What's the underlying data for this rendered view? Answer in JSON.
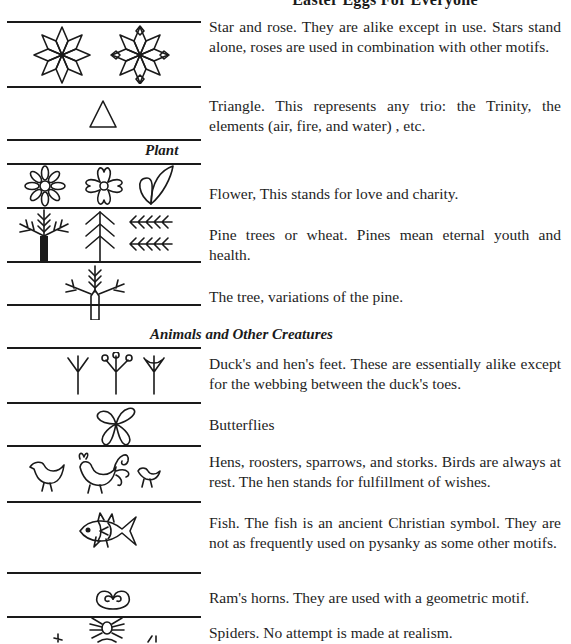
{
  "page": {
    "title": "Easter Eggs For Everyone"
  },
  "sections": {
    "plant": {
      "heading": "Plant"
    },
    "animals": {
      "heading": "Animals and Other Creatures"
    }
  },
  "motifs": [
    {
      "id": "star-rose",
      "icon": "star-rose-icon",
      "text": "Star and rose. They are alike except in use. Stars stand alone, roses are used in combination with other motifs."
    },
    {
      "id": "triangle",
      "icon": "triangle-icon",
      "text": "Triangle. This represents any trio: the Trinity, the elements (air, fire, and water) , etc."
    },
    {
      "id": "flower",
      "icon": "flower-icon",
      "text": "Flower, This stands for love and charity."
    },
    {
      "id": "pine",
      "icon": "pine-tree-icon",
      "text": "Pine trees or wheat. Pines mean eternal youth and health."
    },
    {
      "id": "tree",
      "icon": "tree-icon",
      "text": "The tree, variations of the pine."
    },
    {
      "id": "feet",
      "icon": "bird-feet-icon",
      "text": "Duck's and hen's feet. These are essentially alike except for the webbing between the duck's toes."
    },
    {
      "id": "butterfly",
      "icon": "butterfly-icon",
      "text": "Butterflies"
    },
    {
      "id": "birds",
      "icon": "bird-icon",
      "text": "Hens, roosters, sparrows, and storks. Birds are always at rest. The hen stands for fulfillment of wishes."
    },
    {
      "id": "fish",
      "icon": "fish-icon",
      "text": "Fish. The fish is an ancient Christian symbol. They are not as frequently used on pysanky as some other motifs."
    },
    {
      "id": "rams-horns",
      "icon": "rams-horns-icon",
      "text": "Ram's horns. They are used with a geometric motif."
    },
    {
      "id": "spiders",
      "icon": "spider-icon",
      "text": "Spiders. No attempt is made at realism."
    }
  ]
}
